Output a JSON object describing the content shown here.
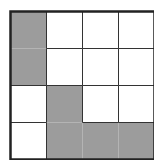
{
  "grid": {
    "rows": 4,
    "cols": 4,
    "cell_width": 36,
    "cell_height": 37,
    "line_color": "#333333",
    "border_color": "#222222",
    "shade_color": "#9c9c9c",
    "background": "#ffffff",
    "shaded_cells": [
      [
        0,
        0
      ],
      [
        1,
        0
      ],
      [
        2,
        1
      ],
      [
        3,
        1
      ],
      [
        3,
        2
      ],
      [
        3,
        3
      ]
    ],
    "shapes": [
      {
        "name": "vertical-domino",
        "cells": [
          [
            0,
            0
          ],
          [
            1,
            0
          ]
        ]
      },
      {
        "name": "L-tetromino",
        "cells": [
          [
            2,
            1
          ],
          [
            3,
            1
          ],
          [
            3,
            2
          ],
          [
            3,
            3
          ]
        ]
      }
    ]
  }
}
